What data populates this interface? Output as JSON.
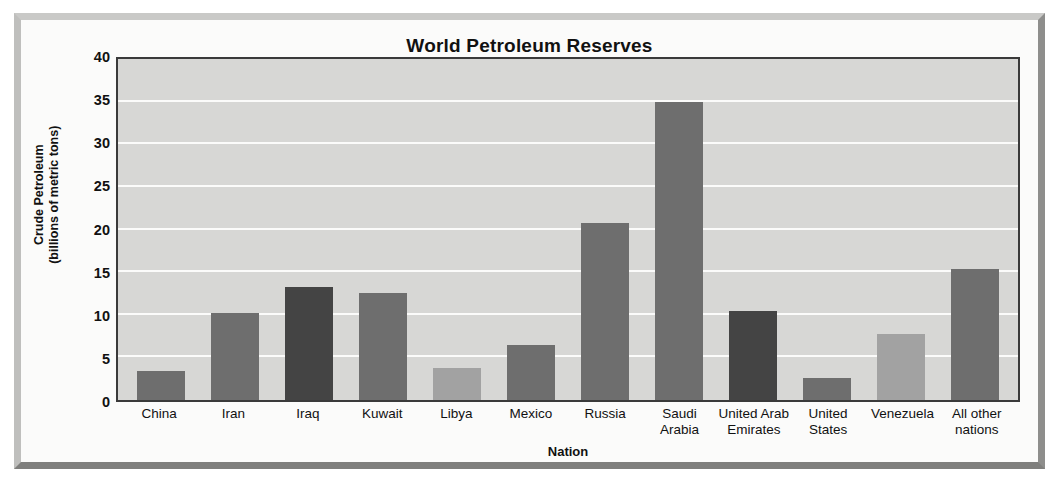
{
  "chart_data": {
    "type": "bar",
    "title": "World Petroleum Reserves",
    "xlabel": "Nation",
    "ylabel": "Crude Petroleum\n(billions of metric tons)",
    "ylabel_line1": "Crude Petroleum",
    "ylabel_line2": "(billions of metric tons)",
    "categories": [
      "China",
      "Iran",
      "Iraq",
      "Kuwait",
      "Libya",
      "Mexico",
      "Russia",
      "Saudi\nArabia",
      "United Arab\nEmirates",
      "United\nStates",
      "Venezuela",
      "All other\nnations"
    ],
    "values": [
      3.4,
      10.2,
      13.3,
      12.6,
      3.8,
      6.5,
      20.8,
      35.0,
      10.4,
      2.6,
      7.8,
      15.4
    ],
    "bar_shades": [
      "shade-mid",
      "shade-mid",
      "shade-dark",
      "shade-mid",
      "shade-light",
      "shade-mid",
      "shade-mid",
      "shade-mid",
      "shade-dark",
      "shade-mid",
      "shade-light",
      "shade-mid"
    ],
    "ylim": [
      0,
      40
    ],
    "yticks": [
      0,
      5,
      10,
      15,
      20,
      25,
      30,
      35,
      40
    ],
    "grid": true,
    "legend": null,
    "colors": {
      "bar_dark": "#444444",
      "bar_mid": "#6e6e6e",
      "bar_light": "#a2a2a2",
      "plot_background": "#d7d7d5",
      "gridline": "#fbfbfa",
      "axis": "#3a3a3a",
      "frame": "#c9c9c7",
      "text": "#111111"
    }
  }
}
